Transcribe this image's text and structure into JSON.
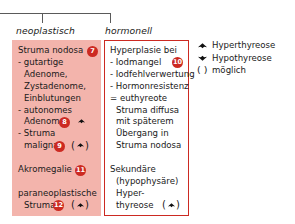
{
  "diagram": {
    "connector": {
      "name": "branch-connector"
    },
    "columns": [
      {
        "id": "neoplastisch",
        "caption": "neoplastisch"
      },
      {
        "id": "hormonell",
        "caption": "hormonell"
      }
    ],
    "left_box": {
      "lines": [
        {
          "text": "Struma nodosa",
          "indent": 0,
          "badge": "7"
        },
        {
          "text": "- gutartige",
          "indent": 0
        },
        {
          "text": "Adenome,",
          "indent": 1
        },
        {
          "text": "Zystadenome,",
          "indent": 1
        },
        {
          "text": "Einblutungen",
          "indent": 1
        },
        {
          "text": "- autonomes",
          "indent": 0
        },
        {
          "text": "Adenom",
          "indent": 1,
          "badge": "8",
          "glyph": "hyper"
        },
        {
          "text": "- Struma",
          "indent": 0
        },
        {
          "text": "maligna",
          "indent": 1,
          "badge": "9",
          "glyph": "hyper-optional"
        },
        {
          "text": "",
          "indent": 0
        },
        {
          "text": "Akromegalie",
          "indent": 0,
          "badge": "11"
        },
        {
          "text": "",
          "indent": 0
        },
        {
          "text": "paraneoplastische",
          "indent": 0
        },
        {
          "text": "Struma",
          "indent": 1,
          "badge": "12",
          "glyph": "hyper-optional"
        }
      ]
    },
    "right_box": {
      "lines": [
        {
          "text": "Hyperplasie bei",
          "indent": 0
        },
        {
          "text": "- Iodmangel",
          "indent": 0,
          "badge": "10"
        },
        {
          "text": "- Iodfehlverwertung",
          "indent": 0
        },
        {
          "text": "- Hormonresistenz",
          "indent": 0
        },
        {
          "text": "= euthyreote",
          "indent": 0
        },
        {
          "text": "Struma diffusa",
          "indent": 1
        },
        {
          "text": "mit späterem",
          "indent": 1
        },
        {
          "text": "Übergang in",
          "indent": 1
        },
        {
          "text": "Struma nodosa",
          "indent": 1
        },
        {
          "text": "",
          "indent": 0
        },
        {
          "text": "Sekundäre",
          "indent": 0
        },
        {
          "text": "(hypophysäre)",
          "indent": 1
        },
        {
          "text": "Hyper-",
          "indent": 1
        },
        {
          "text": "thyreose",
          "indent": 1,
          "glyph": "hyper-optional"
        }
      ]
    },
    "legend": [
      {
        "glyph": "hyper",
        "label": "Hyperthyreose"
      },
      {
        "glyph": "hypo",
        "label": "Hypothyreose"
      },
      {
        "glyph": "paren",
        "label": "möglich"
      }
    ],
    "colors": {
      "pink_fill": "#f3b4ac",
      "red_border": "#cc2a22",
      "badge_fill": "#cc2a22",
      "badge_text": "#ffffff",
      "text": "#1a1a1a",
      "connector": "#5a5a5a"
    }
  }
}
